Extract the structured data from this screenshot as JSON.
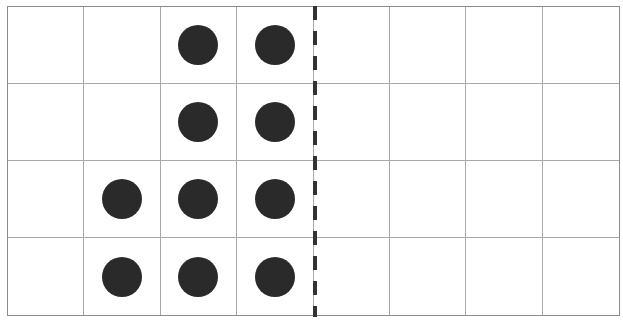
{
  "diagram": {
    "type": "dot-grid",
    "columns": 8,
    "rows": 4,
    "divider_after_column": 4,
    "dot_color": "#2a2a2a",
    "grid_line_color": "#a8a8a8",
    "border_color": "#8c8c8c",
    "divider_color": "#333333",
    "cells": [
      [
        0,
        0,
        1,
        1,
        0,
        0,
        0,
        0
      ],
      [
        0,
        0,
        1,
        1,
        0,
        0,
        0,
        0
      ],
      [
        0,
        1,
        1,
        1,
        0,
        0,
        0,
        0
      ],
      [
        0,
        1,
        1,
        1,
        0,
        0,
        0,
        0
      ]
    ],
    "dot_count": 10,
    "row_counts": [
      2,
      2,
      3,
      3
    ]
  }
}
